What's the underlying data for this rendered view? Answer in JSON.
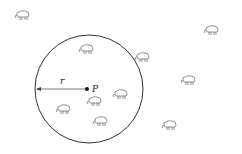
{
  "diagram": {
    "circle": {
      "cx": 89,
      "cy": 89,
      "r": 54,
      "stroke": "#333333"
    },
    "point": {
      "x": 87,
      "y": 89,
      "label": "P"
    },
    "radius_label": "r",
    "sheep": [
      {
        "x": 23,
        "y": 16
      },
      {
        "x": 87,
        "y": 50
      },
      {
        "x": 212,
        "y": 31
      },
      {
        "x": 143,
        "y": 58
      },
      {
        "x": 189,
        "y": 81
      },
      {
        "x": 121,
        "y": 95
      },
      {
        "x": 95,
        "y": 102
      },
      {
        "x": 64,
        "y": 110
      },
      {
        "x": 101,
        "y": 122
      },
      {
        "x": 170,
        "y": 126
      }
    ]
  }
}
